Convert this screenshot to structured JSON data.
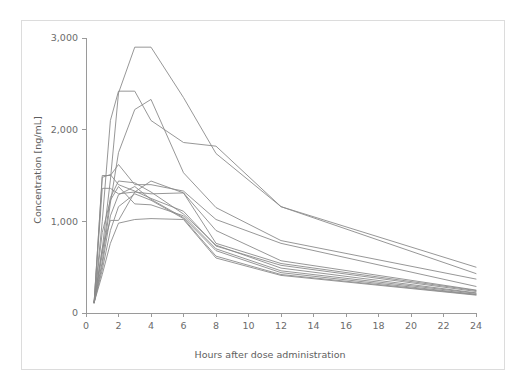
{
  "chart_data": {
    "type": "line",
    "title": "",
    "xlabel": "Hours after dose administration",
    "ylabel": "Concentration [ng/mL]",
    "xlim": [
      0,
      24
    ],
    "ylim": [
      0,
      3000
    ],
    "xticks": [
      0,
      2,
      4,
      6,
      8,
      10,
      12,
      14,
      16,
      18,
      20,
      22,
      24
    ],
    "xticklabels": [
      "0",
      "2",
      "4",
      "6",
      "8",
      "10",
      "12",
      "14",
      "16",
      "18",
      "20",
      "22",
      "24"
    ],
    "yticks": [
      0,
      1000,
      2000,
      3000
    ],
    "yticklabels": [
      "0",
      "1,000",
      "2,000",
      "3,000"
    ],
    "grid": false,
    "legend": false,
    "line_color": "#8b8b8b",
    "x": [
      0.5,
      1,
      1.5,
      2,
      3,
      4,
      6,
      8,
      12,
      24
    ],
    "series": [
      {
        "name": "Subject 1",
        "values": [
          120,
          700,
          1450,
          2400,
          2900,
          2900,
          2350,
          1740,
          1160,
          500
        ]
      },
      {
        "name": "Subject 2",
        "values": [
          110,
          1000,
          2100,
          2420,
          2420,
          2100,
          1860,
          1820,
          1160,
          430
        ]
      },
      {
        "name": "Subject 3",
        "values": [
          115,
          560,
          1200,
          1750,
          2220,
          2330,
          1530,
          1150,
          790,
          370
        ]
      },
      {
        "name": "Subject 4",
        "values": [
          110,
          1500,
          1500,
          1620,
          1400,
          1400,
          1330,
          1020,
          760,
          290
        ]
      },
      {
        "name": "Subject 5",
        "values": [
          120,
          1360,
          1360,
          1300,
          1320,
          1440,
          1310,
          900,
          570,
          250
        ]
      },
      {
        "name": "Subject 6",
        "values": [
          115,
          1480,
          1510,
          1400,
          1330,
          1250,
          1110,
          730,
          520,
          235
        ]
      },
      {
        "name": "Subject 7",
        "values": [
          118,
          700,
          1010,
          1010,
          1320,
          1300,
          1310,
          760,
          540,
          245
        ]
      },
      {
        "name": "Subject 8",
        "values": [
          112,
          640,
          1260,
          1440,
          1420,
          1320,
          1080,
          740,
          490,
          220
        ]
      },
      {
        "name": "Subject 9",
        "values": [
          120,
          880,
          1230,
          1380,
          1190,
          1180,
          1060,
          700,
          460,
          215
        ]
      },
      {
        "name": "Subject 10",
        "values": [
          110,
          520,
          1060,
          1290,
          1380,
          1240,
          1040,
          680,
          440,
          205
        ]
      },
      {
        "name": "Subject 11",
        "values": [
          116,
          470,
          900,
          1160,
          1300,
          1230,
          1030,
          620,
          420,
          200
        ]
      },
      {
        "name": "Subject 12",
        "values": [
          114,
          420,
          760,
          980,
          1020,
          1030,
          1020,
          600,
          410,
          195
        ]
      }
    ]
  }
}
